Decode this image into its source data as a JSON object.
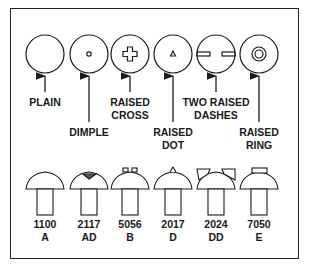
{
  "head_markings": [
    {
      "name": "PLAIN",
      "label": "PLAIN",
      "cx": 45,
      "marking": "none"
    },
    {
      "name": "DIMPLE",
      "label": "DIMPLE",
      "cx": 89,
      "marking": "dimple"
    },
    {
      "name": "RAISED CROSS",
      "label": "RAISED\nCROSS",
      "cx": 130,
      "marking": "cross"
    },
    {
      "name": "RAISED DOT",
      "label": "RAISED\nDOT",
      "cx": 173,
      "marking": "dot"
    },
    {
      "name": "TWO RAISED DASHES",
      "label": "TWO RAISED\nDASHES",
      "cx": 216,
      "marking": "dashes"
    },
    {
      "name": "RAISED RING",
      "label": "RAISED\nRING",
      "cx": 259,
      "marking": "ring"
    }
  ],
  "rivets": [
    {
      "alloy": "1100",
      "code": "A",
      "cx": 45
    },
    {
      "alloy": "2117",
      "code": "AD",
      "cx": 89
    },
    {
      "alloy": "5056",
      "code": "B",
      "cx": 130
    },
    {
      "alloy": "2017",
      "code": "D",
      "cx": 173
    },
    {
      "alloy": "2024",
      "code": "DD",
      "cx": 216
    },
    {
      "alloy": "7050",
      "code": "E",
      "cx": 259
    }
  ],
  "labels": {
    "plain": "PLAIN",
    "dimple": "DIMPLE",
    "cross": "RAISED\nCROSS",
    "dot": "RAISED\nDOT",
    "dashes": "TWO RAISED\nDASHES",
    "ring": "RAISED\nRING"
  }
}
